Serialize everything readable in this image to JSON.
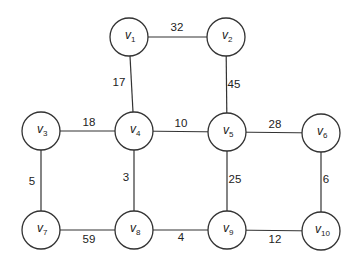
{
  "graph": {
    "type": "weighted-undirected-graph",
    "nodes": [
      {
        "id": "v1",
        "base": "v",
        "sub": "1",
        "x": 129,
        "y": 37
      },
      {
        "id": "v2",
        "base": "v",
        "sub": "2",
        "x": 226,
        "y": 37
      },
      {
        "id": "v3",
        "base": "v",
        "sub": "3",
        "x": 41,
        "y": 131
      },
      {
        "id": "v4",
        "base": "v",
        "sub": "4",
        "x": 134,
        "y": 131
      },
      {
        "id": "v5",
        "base": "v",
        "sub": "5",
        "x": 227,
        "y": 132
      },
      {
        "id": "v6",
        "base": "v",
        "sub": "6",
        "x": 321,
        "y": 133
      },
      {
        "id": "v7",
        "base": "v",
        "sub": "7",
        "x": 41,
        "y": 230
      },
      {
        "id": "v8",
        "base": "v",
        "sub": "8",
        "x": 134,
        "y": 230
      },
      {
        "id": "v9",
        "base": "v",
        "sub": "9",
        "x": 227,
        "y": 230
      },
      {
        "id": "v10",
        "base": "v",
        "sub": "10",
        "x": 321,
        "y": 231
      }
    ],
    "edges": [
      {
        "from": "v1",
        "to": "v2",
        "weight": "32",
        "lx": 177,
        "ly": 31
      },
      {
        "from": "v1",
        "to": "v4",
        "weight": "17",
        "lx": 119,
        "ly": 86
      },
      {
        "from": "v2",
        "to": "v5",
        "weight": "45",
        "lx": 234,
        "ly": 88
      },
      {
        "from": "v3",
        "to": "v4",
        "weight": "18",
        "lx": 89,
        "ly": 126
      },
      {
        "from": "v4",
        "to": "v5",
        "weight": "10",
        "lx": 181,
        "ly": 127
      },
      {
        "from": "v5",
        "to": "v6",
        "weight": "28",
        "lx": 275,
        "ly": 128
      },
      {
        "from": "v3",
        "to": "v7",
        "weight": "5",
        "lx": 32,
        "ly": 185
      },
      {
        "from": "v4",
        "to": "v8",
        "weight": "3",
        "lx": 126,
        "ly": 181
      },
      {
        "from": "v5",
        "to": "v9",
        "weight": "25",
        "lx": 235,
        "ly": 183
      },
      {
        "from": "v6",
        "to": "v10",
        "weight": "6",
        "lx": 326,
        "ly": 183
      },
      {
        "from": "v7",
        "to": "v8",
        "weight": "59",
        "lx": 89,
        "ly": 243
      },
      {
        "from": "v8",
        "to": "v9",
        "weight": "4",
        "lx": 181,
        "ly": 241
      },
      {
        "from": "v9",
        "to": "v10",
        "weight": "12",
        "lx": 275,
        "ly": 243
      }
    ],
    "node_radius": 19,
    "colors": {
      "stroke": "#333333",
      "text": "#222222",
      "background": "#ffffff"
    }
  }
}
